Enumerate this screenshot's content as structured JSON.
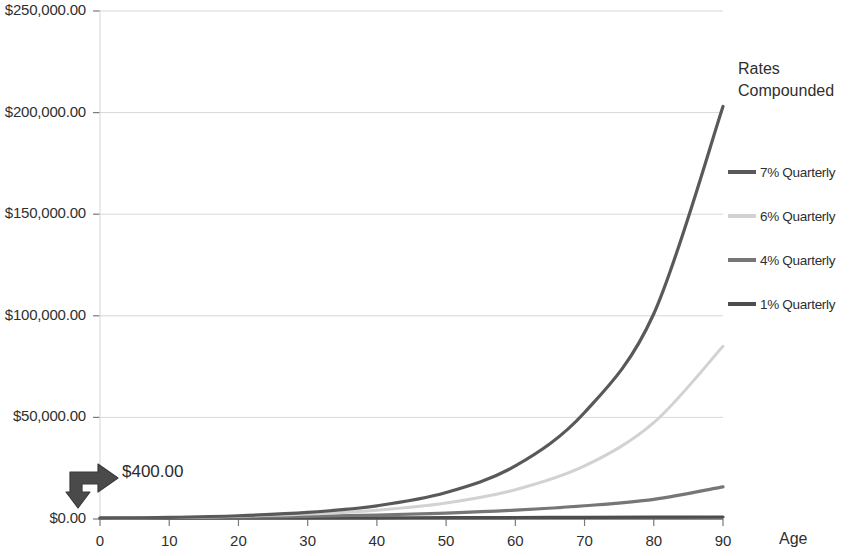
{
  "chart_data": {
    "type": "line",
    "title": "",
    "xlabel": "Age",
    "ylabel": "",
    "x": [
      0,
      10,
      20,
      30,
      40,
      50,
      60,
      70,
      80,
      90
    ],
    "xlim": [
      0,
      90
    ],
    "ylim": [
      0,
      250000
    ],
    "grid": true,
    "legend_position": "right",
    "legend_title_line1": "Rates",
    "legend_title_line2": "Compounded",
    "y_tick_labels": [
      "$250,000.00",
      "$200,000.00",
      "$150,000.00",
      "$100,000.00",
      "$50,000.00",
      "$0.00"
    ],
    "y_tick_values": [
      250000,
      200000,
      150000,
      100000,
      50000,
      0
    ],
    "x_tick_labels": [
      "0",
      "10",
      "20",
      "30",
      "40",
      "50",
      "60",
      "70",
      "80",
      "90"
    ],
    "series": [
      {
        "name": "7% Quarterly",
        "color": "#595959",
        "width": 3.2,
        "values": [
          400,
          800,
          1610,
          3230,
          6480,
          13000,
          26100,
          52400,
          101000,
          203000
        ]
      },
      {
        "name": "6% Quarterly",
        "color": "#d2d2d2",
        "width": 3.0,
        "values": [
          400,
          726,
          1320,
          2400,
          4360,
          7920,
          14400,
          26100,
          47400,
          85000
        ]
      },
      {
        "name": "4% Quarterly",
        "color": "#767676",
        "width": 3.2,
        "values": [
          400,
          596,
          888,
          1322,
          1970,
          2935,
          4370,
          6510,
          9700,
          15800
        ]
      },
      {
        "name": "1% Quarterly",
        "color": "#4d4d4d",
        "width": 3.2,
        "values": [
          400,
          442,
          489,
          540,
          597,
          660,
          729,
          806,
          891,
          985
        ]
      }
    ],
    "annotation": {
      "label": "$400.00",
      "icon": "elbow-arrow-icon",
      "points_to_age": 0,
      "points_to_value": 400
    }
  },
  "axes": {
    "x_axis_name": "Age",
    "y_axis_name": "Account Value"
  }
}
